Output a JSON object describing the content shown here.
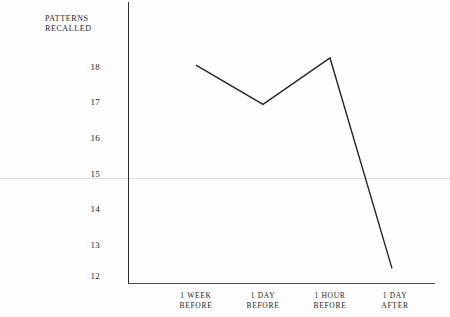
{
  "figure": {
    "background_color": "#fdfdfd",
    "ink_color": "#1d1d1d",
    "line_color": "#262626",
    "artifact_color": "#dcdcdc"
  },
  "axis": {
    "y_caption_line1": "PATTERNS",
    "y_caption_line2": "RECALLED",
    "y_ticks": [
      "18",
      "17",
      "16",
      "15",
      "14",
      "13",
      "12"
    ],
    "x_tick_1_line1": "1 WEEK",
    "x_tick_1_line2": "BEFORE",
    "x_tick_2_line1": "1 DAY",
    "x_tick_2_line2": "BEFORE",
    "x_tick_3_line1": "1 HOUR",
    "x_tick_3_line2": "BEFORE",
    "x_tick_4_line1": "1 DAY",
    "x_tick_4_line2": "AFTER"
  },
  "chart_data": {
    "type": "line",
    "title": "",
    "xlabel": "",
    "ylabel": "PATTERNS RECALLED",
    "categories": [
      "1 WEEK BEFORE",
      "1 DAY BEFORE",
      "1 HOUR BEFORE",
      "1 DAY AFTER"
    ],
    "values": [
      17.8,
      16.7,
      18.0,
      12.1
    ],
    "ylim": [
      12,
      18
    ],
    "yticks": [
      12,
      13,
      14,
      15,
      16,
      17,
      18
    ],
    "grid": false,
    "legend": null,
    "markers": false,
    "line_color": "#262626",
    "line_width": 1.4
  }
}
